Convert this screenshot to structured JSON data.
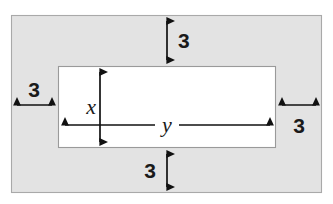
{
  "figure": {
    "canvas": {
      "width": 333,
      "height": 204,
      "background": "#ffffff"
    },
    "colors": {
      "border_region_fill": "#e3e3e3",
      "border_region_stroke": "#a9a9a9",
      "inner_region_fill": "#ffffff",
      "inner_region_stroke": "#9a9a9a",
      "arrow_color": "#111111",
      "text_color": "#1a1a1a"
    },
    "outer_rect": {
      "x": 11,
      "y": 15,
      "width": 311,
      "height": 178
    },
    "inner_rect": {
      "x": 58,
      "y": 66,
      "width": 218,
      "height": 82
    }
  },
  "dimensions": {
    "top": {
      "value": "3",
      "orientation": "vertical",
      "label_side": "right"
    },
    "bottom": {
      "value": "3",
      "orientation": "vertical",
      "label_side": "left"
    },
    "left": {
      "value": "3",
      "orientation": "horizontal",
      "label_side": "above"
    },
    "right": {
      "value": "3",
      "orientation": "horizontal",
      "label_side": "below"
    }
  },
  "variables": {
    "height_label": "x",
    "width_label": "y"
  }
}
